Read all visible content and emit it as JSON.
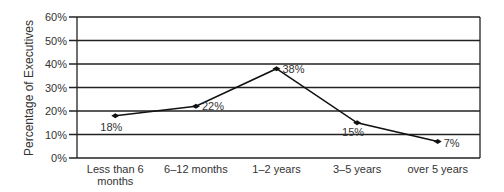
{
  "chart_data": {
    "type": "line",
    "title": "",
    "xlabel": "",
    "ylabel": "Percentage of Executives",
    "categories": [
      "Less than 6 months",
      "6–12 months",
      "1–2 years",
      "3–5 years",
      "over 5 years"
    ],
    "category_lines": [
      [
        "Less than 6",
        "months"
      ],
      [
        "6–12 months"
      ],
      [
        "1–2 years"
      ],
      [
        "3–5 years"
      ],
      [
        "over 5 years"
      ]
    ],
    "series": [
      {
        "name": "Percentage of Executives",
        "values": [
          18,
          22,
          38,
          15,
          7
        ]
      }
    ],
    "data_labels": [
      "18%",
      "22%",
      "38%",
      "15%",
      "7%"
    ],
    "ylim": [
      0,
      60
    ],
    "yticks": [
      "0%",
      "10%",
      "20%",
      "30%",
      "40%",
      "50%",
      "60%"
    ],
    "grid": true,
    "legend": "none"
  },
  "colors": {
    "line": "#111111",
    "grid": "#222222",
    "text": "#333333"
  }
}
